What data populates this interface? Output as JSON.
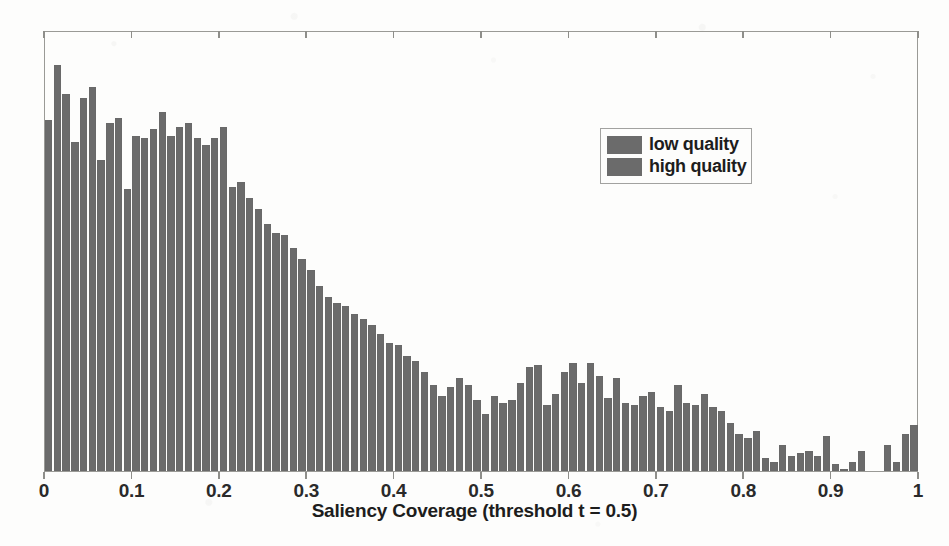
{
  "chart_data": {
    "type": "bar",
    "title": "",
    "subtitle": "",
    "xlabel": "Saliency Coverage (threshold t = 0.5)",
    "ylabel": "",
    "xlim": [
      0,
      1
    ],
    "ylim": [
      0,
      1
    ],
    "bin_width": 0.01,
    "grid": false,
    "y_axis_visible": false,
    "xticks": [
      0,
      0.1,
      0.2,
      0.3,
      0.4,
      0.5,
      0.6,
      0.7,
      0.8,
      0.9,
      1
    ],
    "xticklabels": [
      "0",
      "0.1",
      "0.2",
      "0.3",
      "0.4",
      "0.5",
      "0.6",
      "0.7",
      "0.8",
      "0.9",
      "1"
    ],
    "legend_position": "upper right",
    "legend_entries": [
      {
        "label": "low quality",
        "color": "#6b6b6b"
      },
      {
        "label": "high quality",
        "color": "#6b6b6b"
      }
    ],
    "bar_color": "#6b6b6b",
    "categories": [
      0.005,
      0.015,
      0.025,
      0.035,
      0.045,
      0.055,
      0.065,
      0.075,
      0.085,
      0.095,
      0.105,
      0.115,
      0.125,
      0.135,
      0.145,
      0.155,
      0.165,
      0.175,
      0.185,
      0.195,
      0.205,
      0.215,
      0.225,
      0.235,
      0.245,
      0.255,
      0.265,
      0.275,
      0.285,
      0.295,
      0.305,
      0.315,
      0.325,
      0.335,
      0.345,
      0.355,
      0.365,
      0.375,
      0.385,
      0.395,
      0.405,
      0.415,
      0.425,
      0.435,
      0.445,
      0.455,
      0.465,
      0.475,
      0.485,
      0.495,
      0.505,
      0.515,
      0.525,
      0.535,
      0.545,
      0.555,
      0.565,
      0.575,
      0.585,
      0.595,
      0.605,
      0.615,
      0.625,
      0.635,
      0.645,
      0.655,
      0.665,
      0.675,
      0.685,
      0.695,
      0.705,
      0.715,
      0.725,
      0.735,
      0.745,
      0.755,
      0.765,
      0.775,
      0.785,
      0.795,
      0.805,
      0.815,
      0.825,
      0.835,
      0.845,
      0.855,
      0.865,
      0.875,
      0.885,
      0.895,
      0.905,
      0.915,
      0.925,
      0.935,
      0.945,
      0.955,
      0.965,
      0.975,
      0.985,
      0.995
    ],
    "values": [
      0.795,
      0.92,
      0.855,
      0.745,
      0.845,
      0.87,
      0.705,
      0.79,
      0.8,
      0.64,
      0.76,
      0.755,
      0.775,
      0.815,
      0.76,
      0.78,
      0.79,
      0.755,
      0.74,
      0.755,
      0.78,
      0.645,
      0.655,
      0.62,
      0.595,
      0.56,
      0.54,
      0.535,
      0.505,
      0.48,
      0.455,
      0.42,
      0.395,
      0.38,
      0.375,
      0.355,
      0.345,
      0.33,
      0.31,
      0.29,
      0.285,
      0.26,
      0.25,
      0.225,
      0.195,
      0.17,
      0.19,
      0.21,
      0.195,
      0.16,
      0.13,
      0.17,
      0.155,
      0.16,
      0.2,
      0.235,
      0.24,
      0.15,
      0.175,
      0.225,
      0.245,
      0.2,
      0.245,
      0.215,
      0.165,
      0.21,
      0.155,
      0.15,
      0.17,
      0.18,
      0.145,
      0.135,
      0.195,
      0.155,
      0.15,
      0.175,
      0.145,
      0.135,
      0.11,
      0.085,
      0.075,
      0.09,
      0.03,
      0.02,
      0.06,
      0.035,
      0.04,
      0.045,
      0.035,
      0.08,
      0.015,
      0.005,
      0.02,
      0.045,
      0.0,
      0.0,
      0.06,
      0.02,
      0.085,
      0.105
    ]
  }
}
